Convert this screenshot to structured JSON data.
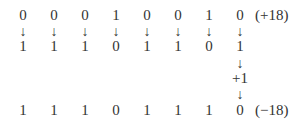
{
  "diagram": {
    "original": {
      "bits": [
        "0",
        "0",
        "0",
        "1",
        "0",
        "0",
        "1",
        "0"
      ],
      "label": "(+18)"
    },
    "inverted": {
      "bits": [
        "1",
        "1",
        "1",
        "0",
        "1",
        "1",
        "0",
        "1"
      ]
    },
    "add_one": "+1",
    "result": {
      "bits": [
        "1",
        "1",
        "1",
        "0",
        "1",
        "1",
        "1",
        "0"
      ],
      "label": "(−18)"
    },
    "arrow_glyph": "↓"
  }
}
